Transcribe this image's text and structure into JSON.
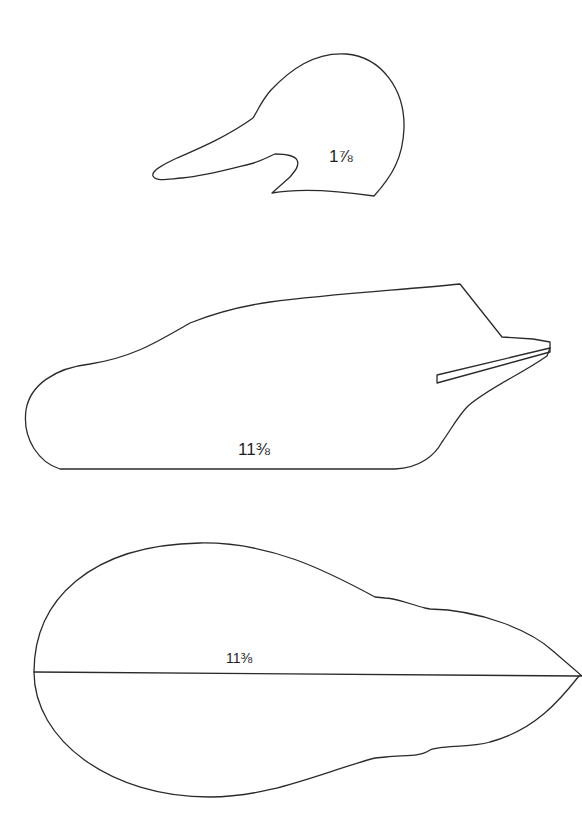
{
  "diagram": {
    "type": "decoy pattern (duck carving template)",
    "background_color": "#ffffff",
    "line_color": "#2a2a2a",
    "shapes": [
      {
        "id": "head-profile",
        "description": "Head side profile with bill pointing left",
        "dimension_label": "1⅞"
      },
      {
        "id": "body-side-profile",
        "description": "Body side profile with tail at right and keel slot",
        "dimension_label": "11⅜"
      },
      {
        "id": "body-top-view",
        "description": "Body top (plan) view with center line",
        "dimension_label": "11⅜"
      }
    ]
  },
  "labels": {
    "head": "1⅞",
    "side": "11⅜",
    "top": "11⅜"
  }
}
